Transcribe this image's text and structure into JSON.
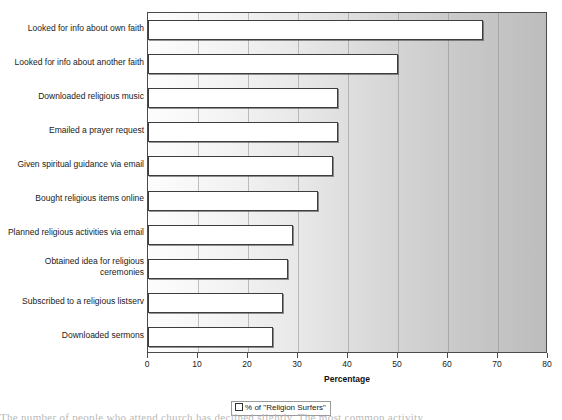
{
  "chart_data": {
    "type": "bar",
    "orientation": "horizontal",
    "title": "",
    "xlabel": "Percentage",
    "ylabel": "",
    "xlim": [
      0,
      80
    ],
    "xticks": [
      0,
      10,
      20,
      30,
      40,
      50,
      60,
      70,
      80
    ],
    "grid": true,
    "legend_position": "bottom",
    "legend": [
      "% of \"Religion Surfers\""
    ],
    "categories": [
      "Looked for info about own faith",
      "Looked for info about another faith",
      "Downloaded religious music",
      "Emailed a prayer request",
      "Given spiritual guidance via email",
      "Bought religious items online",
      "Planned religious activities via email",
      "Obtained idea for religious\nceremonies",
      "Subscribed to a religious listserv",
      "Downloaded sermons"
    ],
    "series": [
      {
        "name": "% of \"Religion Surfers\"",
        "values": [
          67,
          50,
          38,
          38,
          37,
          34,
          29,
          28,
          27,
          25
        ]
      }
    ]
  },
  "axis": {
    "x_title": "Percentage",
    "tick_labels": [
      "0",
      "10",
      "20",
      "30",
      "40",
      "50",
      "60",
      "70",
      "80"
    ]
  },
  "legend": {
    "entry_label": "% of \"Religion Surfers\""
  },
  "page": {
    "bottom_text_sliver": "The number of people who attend church has declined slightly. The most common activity"
  },
  "colors": {
    "bar_fill": "#ffffff",
    "bar_border": "#3d3d3d",
    "plot_border": "#4a4a4a",
    "gridline": "#8e8e8e",
    "text": "#1a1a1a"
  }
}
